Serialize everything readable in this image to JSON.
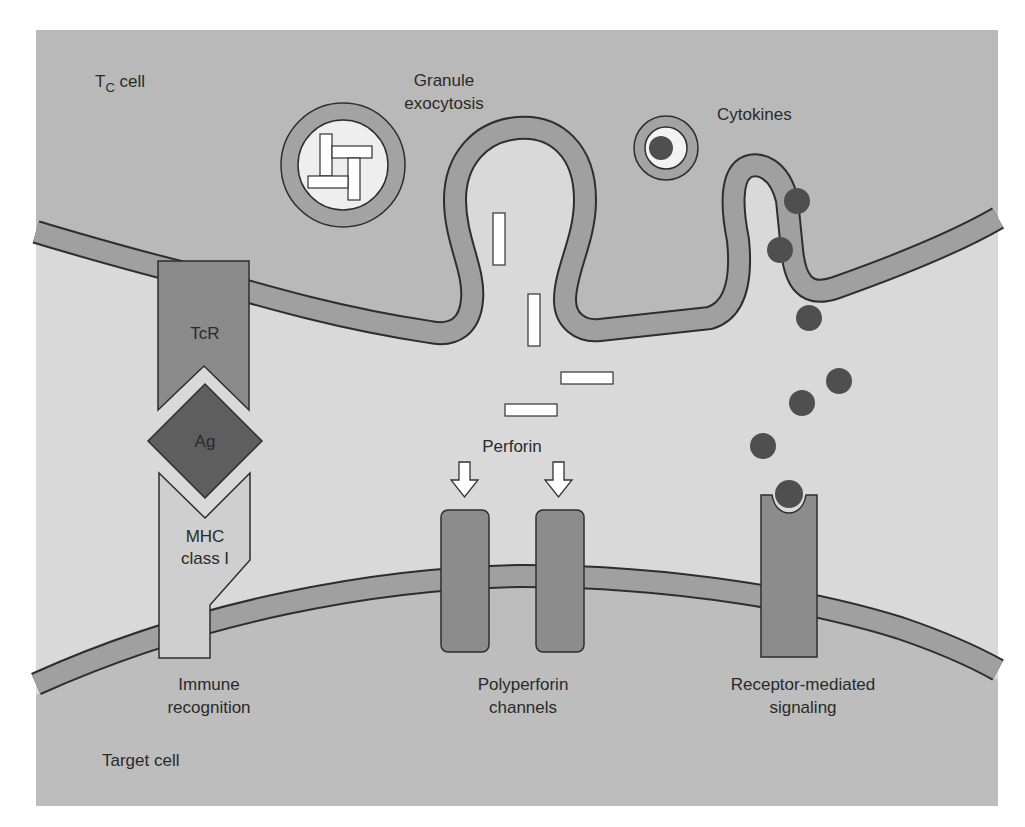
{
  "figure": {
    "tc_cell_label_main": "T",
    "tc_cell_label_sub": "C",
    "tc_cell_label_rest": " cell",
    "target_cell_label": "Target cell",
    "granule_label_line1": "Granule",
    "granule_label_line2": "exocytosis",
    "cytokines_label": "Cytokines",
    "tcr_label": "TcR",
    "ag_label": "Ag",
    "mhc_label_line1": "MHC",
    "mhc_label_line2": "class I",
    "perforin_label": "Perforin",
    "immune_label_line1": "Immune",
    "immune_label_line2": "recognition",
    "polyperforin_label_line1": "Polyperforin",
    "polyperforin_label_line2": "channels",
    "receptor_label_line1": "Receptor-mediated",
    "receptor_label_line2": "signaling"
  },
  "colors": {
    "tc_cell_fill": "#b9b9b9",
    "synapse_fill": "#d9d9d9",
    "target_cell_fill": "#bdbdbd",
    "membrane_fill": "#a0a0a0",
    "membrane_stroke": "#2e2e2e",
    "tcr_fill": "#8a8a8a",
    "ag_fill": "#5e5e5e",
    "mhc_fill": "#cfcfcf",
    "channel_fill": "#8c8c8c",
    "cytokine_fill": "#4f4f4f",
    "granule_inner": "#eeeeee",
    "perforin_fill": "#ffffff"
  }
}
